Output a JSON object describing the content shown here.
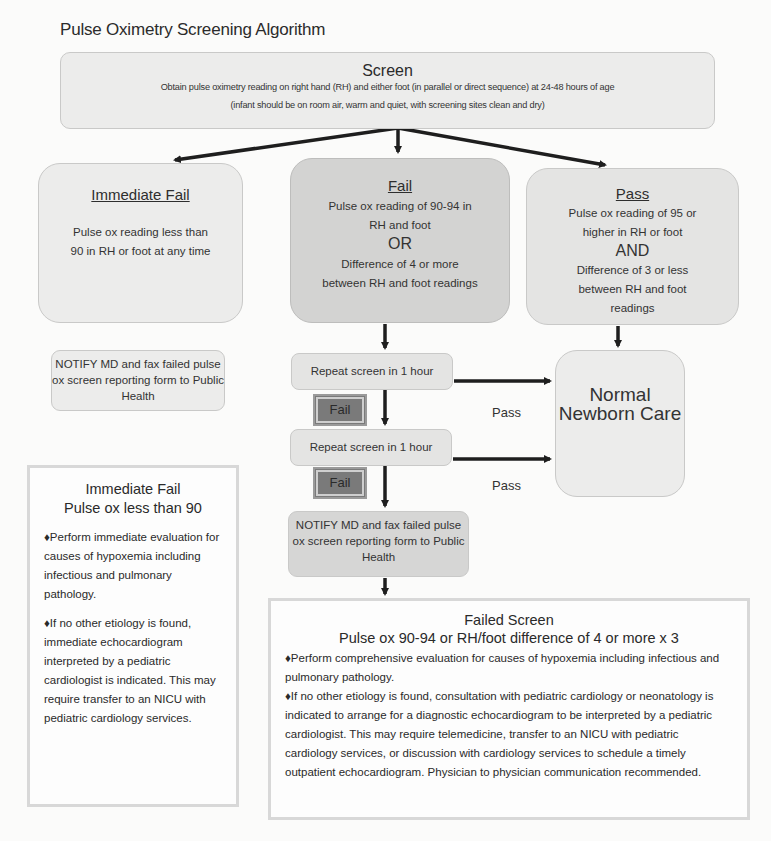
{
  "title": "Pulse Oximetry Screening Algorithm",
  "screen": {
    "heading": "Screen",
    "line1": "Obtain pulse oximetry reading on right hand (RH) and either foot (in parallel or direct sequence) at 24-48 hours of age",
    "line2": "(infant should be on room air, warm and quiet, with screening sites clean and dry)"
  },
  "immediate_fail": {
    "heading": "Immediate Fail",
    "text": "Pulse ox reading less than 90 in RH or foot at any time"
  },
  "fail": {
    "heading": "Fail",
    "line1": "Pulse ox reading of 90-94 in RH and foot",
    "or": "OR",
    "line2": "Difference of 4 or more between RH and foot readings"
  },
  "pass": {
    "heading": "Pass",
    "line1": "Pulse ox reading of 95 or higher in RH or foot",
    "and": "AND",
    "line2": "Difference of 3 or less between RH and foot readings"
  },
  "notify_left": "NOTIFY MD and fax failed pulse ox screen reporting form to Public Health",
  "repeat1": "Repeat screen in 1 hour",
  "repeat2": "Repeat screen in 1 hour",
  "fail_tag1": "Fail",
  "fail_tag2": "Fail",
  "pass_label1": "Pass",
  "pass_label2": "Pass",
  "normal_care": "Normal Newborn Care",
  "notify_center": "NOTIFY MD and fax failed pulse ox screen reporting form to Public Health",
  "panel_immediate": {
    "heading1": "Immediate Fail",
    "heading2": "Pulse ox less than 90",
    "bullets": [
      "♦Perform immediate evaluation for causes of hypoxemia including infectious and pulmonary pathology.",
      "♦If no other etiology is found, immediate echocardiogram interpreted by a pediatric cardiologist is indicated. This may require transfer to an NICU with pediatric cardiology services."
    ]
  },
  "panel_failed": {
    "heading1": "Failed Screen",
    "heading2": "Pulse ox 90-94 or RH/foot difference of 4 or more x 3",
    "bullets": [
      "♦Perform comprehensive evaluation for causes of hypoxemia including infectious and pulmonary pathology.",
      "♦If no other etiology is found, consultation with pediatric cardiology or neonatology is indicated to arrange for a diagnostic echocardiogram to be interpreted by a pediatric cardiologist. This may require telemedicine, transfer to an NICU with pediatric cardiology services, or discussion with cardiology services to schedule a timely outpatient echocardiogram. Physician to physician communication recommended."
    ]
  },
  "colors": {
    "box_fill": "#e4e4e3",
    "box_dark_fill": "#d3d3d2",
    "fail_tag_fill": "#7a7a7a",
    "arrow": "#1e1e1e",
    "panel_border": "#d8d8d8"
  }
}
